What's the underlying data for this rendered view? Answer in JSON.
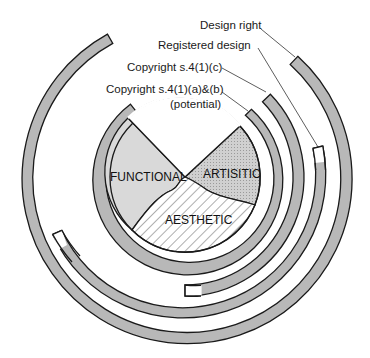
{
  "diagram": {
    "labels": {
      "design_right": "Design right",
      "registered_design": "Registered design",
      "copyright_c": "Copyright s.4(1)(c)",
      "copyright_ab_line1": "Copyright s.4(1)(a)&(b)",
      "copyright_ab_line2": "(potential)"
    },
    "segments": {
      "functional": "FUNCTIONAL",
      "artistic": "ARTISITIC",
      "aesthetic": "AESTHETIC"
    },
    "colors": {
      "ring_fill": "#b8b8b8",
      "functional_fill": "#d9d9d9",
      "artistic_fill": "#c4c4c4",
      "outline": "#1a1a1a",
      "background": "#ffffff"
    }
  }
}
